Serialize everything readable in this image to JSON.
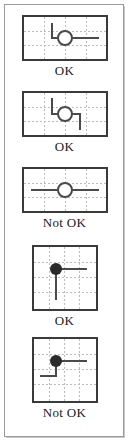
{
  "figure": {
    "colors": {
      "background": "#ffffff",
      "frame": "#9a9a9a",
      "panel_border": "#3a3a3a",
      "grid": "#b8b8b8",
      "wire": "#4a4a4a",
      "node_fill": "#2a2a2a",
      "label_text": "#1a1a1a"
    },
    "panels": [
      {
        "id": "corner-open-node",
        "verdict": "OK",
        "shape": "wide",
        "node_style": "open-circle",
        "description": "Vertical wire from top bends right at a corner; open circle node sits on the horizontal wire which continues to the right",
        "grid_cols": 4,
        "grid_rows": 3
      },
      {
        "id": "stagger-open-node",
        "verdict": "OK",
        "shape": "wide",
        "node_style": "open-circle",
        "description": "Wire steps down from top, runs right through an open circle node, then steps down again toward the bottom",
        "grid_cols": 4,
        "grid_rows": 3
      },
      {
        "id": "straight-open-node",
        "verdict": "Not OK",
        "shape": "wide",
        "node_style": "open-circle",
        "description": "Single straight horizontal wire passing through an open circle node with no branch",
        "grid_cols": 4,
        "grid_rows": 3
      },
      {
        "id": "tee-filled-node",
        "verdict": "OK",
        "shape": "square",
        "node_style": "filled-dot",
        "description": "Filled dot junction with one wire leaving to the right and one wire leaving downward",
        "grid_cols": 4,
        "grid_rows": 4
      },
      {
        "id": "stagger-filled-node",
        "verdict": "Not OK",
        "shape": "square",
        "node_style": "filled-dot",
        "description": "Filled dot junction with a wire to the right and a wire dropping then turning left",
        "grid_cols": 4,
        "grid_rows": 4
      }
    ]
  }
}
